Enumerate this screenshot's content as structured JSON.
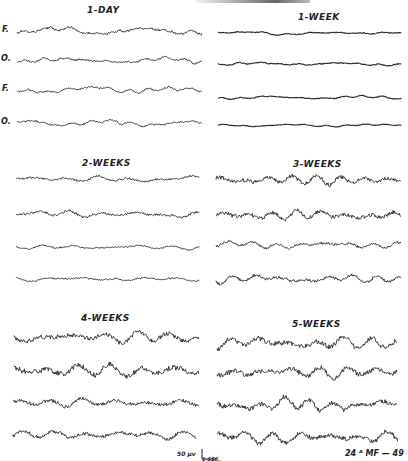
{
  "chart_data": {
    "type": "line",
    "panels": [
      {
        "label": "1-DAY",
        "leads": [
          "F.",
          "O.",
          "F.",
          "O."
        ],
        "amplitude": 4,
        "freq": "low-fast mix"
      },
      {
        "label": "1-WEEK",
        "leads": [
          "",
          "",
          "",
          ""
        ],
        "amplitude": 3,
        "freq": "low fast"
      },
      {
        "label": "2-WEEKS",
        "leads": [
          "",
          "",
          "",
          ""
        ],
        "amplitude": 5,
        "freq": "moderate"
      },
      {
        "label": "3-WEEKS",
        "leads": [
          "",
          "",
          "",
          ""
        ],
        "amplitude": 9,
        "freq": "rhythmic"
      },
      {
        "label": "4-WEEKS",
        "leads": [
          "",
          "",
          "",
          ""
        ],
        "amplitude": 11,
        "freq": "high voltage"
      },
      {
        "label": "5-WEEKS",
        "leads": [
          "",
          "",
          "",
          ""
        ],
        "amplitude": 12,
        "freq": "high voltage"
      }
    ],
    "scale_bar": {
      "voltage": "50 µv",
      "time": "1-SEC."
    },
    "xlabel": "",
    "ylabel": "",
    "grid": false,
    "legend": "none"
  },
  "panels": {
    "p1": {
      "title": "1-DAY"
    },
    "p2": {
      "title": "1-WEEK"
    },
    "p3": {
      "title": "2-WEEKS"
    },
    "p4": {
      "title": "3-WEEKS"
    },
    "p5": {
      "title": "4-WEEKS"
    },
    "p6": {
      "title": "5-WEEKS"
    }
  },
  "leads": {
    "f1": "F.",
    "o1": "O.",
    "f2": "F.",
    "o2": "O."
  },
  "scale": {
    "voltage": "50 µv",
    "time": "1-SEC."
  },
  "figure_id": "24 ᴬ MF — 49",
  "traces": [
    {
      "x0": 17,
      "x1": 202,
      "y": 31,
      "amp": 4,
      "seed": 1,
      "lowAmp": 4,
      "fast": 1.2
    },
    {
      "x0": 17,
      "x1": 202,
      "y": 60,
      "amp": 3,
      "seed": 2,
      "lowAmp": 3,
      "fast": 1.0
    },
    {
      "x0": 17,
      "x1": 202,
      "y": 90,
      "amp": 3,
      "seed": 3,
      "lowAmp": 3,
      "fast": 1.0
    },
    {
      "x0": 17,
      "x1": 202,
      "y": 123,
      "amp": 3,
      "seed": 4,
      "lowAmp": 3,
      "fast": 1.0
    },
    {
      "x0": 218,
      "x1": 402,
      "y": 33,
      "amp": 1.5,
      "seed": 5,
      "lowAmp": 1.5,
      "fast": 1.2
    },
    {
      "x0": 218,
      "x1": 402,
      "y": 64,
      "amp": 1.5,
      "seed": 6,
      "lowAmp": 1.5,
      "fast": 1.0
    },
    {
      "x0": 218,
      "x1": 402,
      "y": 98,
      "amp": 1.5,
      "seed": 7,
      "lowAmp": 1.5,
      "fast": 1.0
    },
    {
      "x0": 218,
      "x1": 402,
      "y": 125,
      "amp": 1.2,
      "seed": 8,
      "lowAmp": 1.2,
      "fast": 1.0
    },
    {
      "x0": 16,
      "x1": 200,
      "y": 179,
      "amp": 4,
      "seed": 9,
      "lowAmp": 2,
      "fast": 1.6
    },
    {
      "x0": 16,
      "x1": 200,
      "y": 214,
      "amp": 5,
      "seed": 10,
      "lowAmp": 2,
      "fast": 1.6
    },
    {
      "x0": 16,
      "x1": 200,
      "y": 247,
      "amp": 3,
      "seed": 11,
      "lowAmp": 1.5,
      "fast": 1.6
    },
    {
      "x0": 16,
      "x1": 200,
      "y": 279,
      "amp": 3,
      "seed": 12,
      "lowAmp": 1.5,
      "fast": 1.6
    },
    {
      "x0": 216,
      "x1": 401,
      "y": 180,
      "amp": 8,
      "seed": 13,
      "lowAmp": 2,
      "fast": 1.2
    },
    {
      "x0": 216,
      "x1": 401,
      "y": 215,
      "amp": 8,
      "seed": 14,
      "lowAmp": 2,
      "fast": 1.2
    },
    {
      "x0": 216,
      "x1": 401,
      "y": 245,
      "amp": 5,
      "seed": 15,
      "lowAmp": 2,
      "fast": 1.2
    },
    {
      "x0": 216,
      "x1": 401,
      "y": 279,
      "amp": 6,
      "seed": 16,
      "lowAmp": 2,
      "fast": 1.2
    },
    {
      "x0": 14,
      "x1": 199,
      "y": 338,
      "amp": 9,
      "seed": 17,
      "lowAmp": 3,
      "fast": 1.6
    },
    {
      "x0": 14,
      "x1": 199,
      "y": 370,
      "amp": 11,
      "seed": 18,
      "lowAmp": 3,
      "fast": 1.6
    },
    {
      "x0": 13,
      "x1": 199,
      "y": 403,
      "amp": 7,
      "seed": 19,
      "lowAmp": 2,
      "fast": 1.6
    },
    {
      "x0": 12,
      "x1": 196,
      "y": 435,
      "amp": 7,
      "seed": 20,
      "lowAmp": 2,
      "fast": 1.6
    },
    {
      "x0": 217,
      "x1": 397,
      "y": 342,
      "amp": 10,
      "seed": 21,
      "lowAmp": 3,
      "fast": 1.4
    },
    {
      "x0": 217,
      "x1": 397,
      "y": 372,
      "amp": 10,
      "seed": 22,
      "lowAmp": 3,
      "fast": 1.4
    },
    {
      "x0": 217,
      "x1": 397,
      "y": 405,
      "amp": 10,
      "seed": 23,
      "lowAmp": 3,
      "fast": 1.2
    },
    {
      "x0": 217,
      "x1": 398,
      "y": 437,
      "amp": 9,
      "seed": 24,
      "lowAmp": 3,
      "fast": 1.4
    }
  ]
}
